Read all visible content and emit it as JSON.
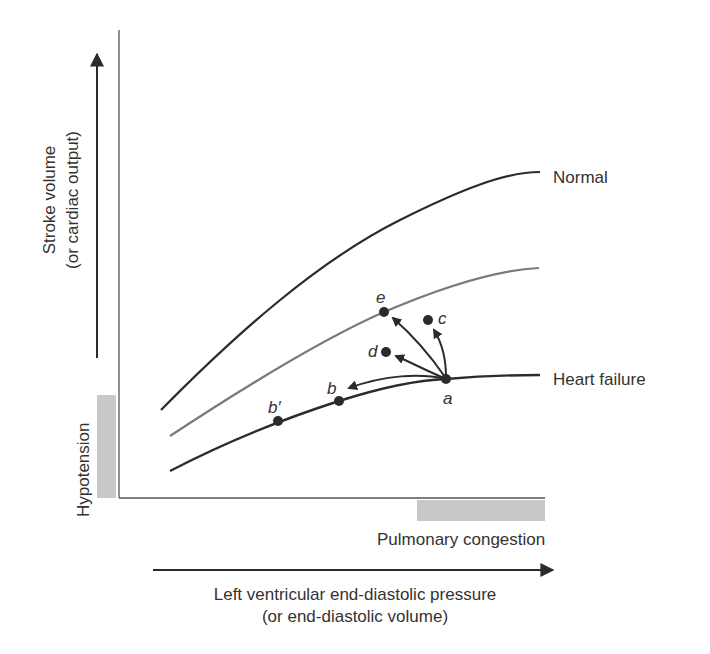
{
  "diagram": {
    "type": "frank-starling-curves",
    "y_axis_label_line1": "Stroke volume",
    "y_axis_label_line2": "(or cardiac output)",
    "x_axis_label_line1": "Left ventricular end-diastolic pressure",
    "x_axis_label_line2": "(or end-diastolic volume)",
    "hypotension_label": "Hypotension",
    "pulmonary_congestion_label": "Pulmonary congestion",
    "curves": [
      {
        "name": "Normal",
        "label": "Normal",
        "color": "#2b2b2b"
      },
      {
        "name": "Intermediate",
        "label": "",
        "color": "#7a7a7a"
      },
      {
        "name": "Heart failure",
        "label": "Heart failure",
        "color": "#2b2b2b"
      }
    ],
    "points": {
      "a": "a",
      "b": "b",
      "b_prime": "b′",
      "c": "c",
      "d": "d",
      "e": "e"
    },
    "arrows": [
      {
        "from": "a",
        "to": "b"
      },
      {
        "from": "a",
        "to": "d"
      },
      {
        "from": "a",
        "to": "e"
      },
      {
        "from": "a",
        "to": "c"
      }
    ],
    "colors": {
      "line": "#2b2b2b",
      "gray_curve": "#7a7a7a",
      "shade": "#c8c8c8",
      "text": "#333333"
    }
  }
}
